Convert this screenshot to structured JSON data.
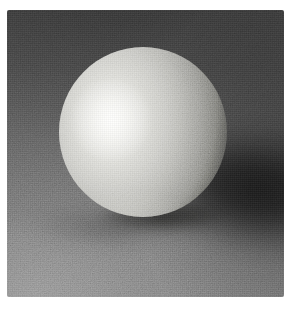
{
  "image": {
    "description": "Black-and-white studio photograph of a smooth matte sphere resting on a gray fabric backdrop, lit from the upper left with a soft specular highlight and a long soft shadow cast to the right.",
    "subject": "sphere",
    "lighting": "upper-left key light",
    "palette": {
      "page_background": "#ffffff",
      "backdrop_top": "#3d3d3d",
      "backdrop_mid": "#585858",
      "backdrop_bottom": "#808080",
      "sphere_highlight": "#fdfdfb",
      "sphere_base": "#cacac5",
      "sphere_shadow": "#4b4b47",
      "cast_shadow": "#0a0a0a"
    }
  }
}
